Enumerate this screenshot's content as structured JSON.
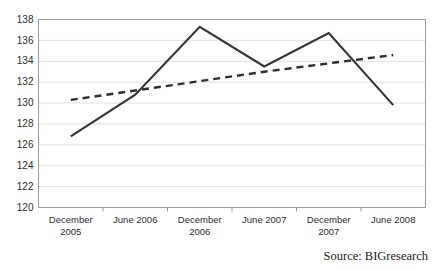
{
  "source_note": "Source: BIGresearch",
  "chart_data": {
    "type": "line",
    "title": "",
    "xlabel": "",
    "ylabel": "",
    "ylim": [
      120,
      138
    ],
    "ytick_step": 2,
    "yticks": [
      120,
      122,
      124,
      126,
      128,
      130,
      132,
      134,
      136,
      138
    ],
    "ytick_labels": [
      "120",
      "122",
      "124",
      "126",
      "128",
      "130",
      "132",
      "134",
      "136",
      "138"
    ],
    "categories": [
      "December 2005",
      "June 2006",
      "December 2006",
      "June 2007",
      "December 2007",
      "June 2008"
    ],
    "category_lines": [
      [
        "December",
        "2005"
      ],
      [
        "June 2006",
        ""
      ],
      [
        "December",
        "2006"
      ],
      [
        "June 2007",
        ""
      ],
      [
        "December",
        "2007"
      ],
      [
        "June 2008",
        ""
      ]
    ],
    "grid": "horizontal",
    "legend": "none",
    "series": [
      {
        "name": "data",
        "style": "solid",
        "color": "#333333",
        "values": [
          126.8,
          130.8,
          137.3,
          133.5,
          136.7,
          129.8
        ]
      },
      {
        "name": "trendline",
        "style": "dashed",
        "color": "#2e2e2e",
        "values": [
          130.3,
          131.2,
          132.1,
          133.0,
          133.8,
          134.6
        ]
      }
    ]
  }
}
